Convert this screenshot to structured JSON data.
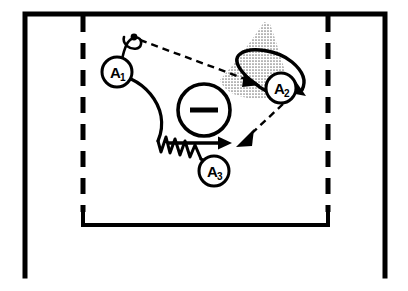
{
  "figure": {
    "title": "",
    "background_color": "#ffffff",
    "stroke_color": "#000000",
    "stipple_color": "#8c8c8c",
    "width": 408,
    "height": 291
  },
  "frames": {
    "outer": {
      "name": "outer-solid-frame",
      "style": "solid",
      "sides": [
        "top",
        "left",
        "right"
      ],
      "x": 25,
      "y": 14,
      "width": 360,
      "height": 262,
      "stroke_width": 5
    },
    "inner": {
      "name": "inner-dashed-frame",
      "style": "dashed-sides-solid-bottom",
      "sides": [
        "left",
        "right",
        "bottom"
      ],
      "x": 83,
      "y": 14,
      "width": 245,
      "height": 211,
      "stroke_width": 5,
      "dash_pattern": "14 10"
    }
  },
  "nodes": [
    {
      "id": "A1",
      "label": "A",
      "subscript": "1",
      "cx": 117,
      "cy": 72,
      "r": 15,
      "name": "node-a1"
    },
    {
      "id": "A2",
      "label": "A",
      "subscript": "2",
      "cx": 281,
      "cy": 88,
      "r": 15,
      "name": "node-a2"
    },
    {
      "id": "A3",
      "label": "A",
      "subscript": "3",
      "cx": 214,
      "cy": 171,
      "r": 15,
      "name": "node-a3"
    }
  ],
  "center_symbol": {
    "name": "minus-circle-symbol",
    "glyph": "minus",
    "cx": 204,
    "cy": 110,
    "r": 26,
    "bar_half_width": 14,
    "bar_thickness": 5
  },
  "antenna": {
    "name": "a1-antenna",
    "dot_cx": 133,
    "dot_cy": 37,
    "dot_r": 3.2,
    "loop_label": "teardrop-loop"
  },
  "stipple_region": {
    "name": "a2-beam-cone",
    "description": "halftone dotted cone / beam spreading up-left from A2",
    "fill": "#8c8c8c",
    "opacity": 0.55
  },
  "edges": [
    {
      "id": "e1",
      "name": "edge-a1-to-a2-dashed",
      "from": "A1-antenna",
      "to": "A2",
      "style": "dashed",
      "arrowhead": "solid-triangle"
    },
    {
      "id": "e2",
      "name": "edge-a1-to-a3-wavy",
      "from": "A1",
      "to": "A3",
      "style": "curve-then-zigzag",
      "arrowhead": "none"
    },
    {
      "id": "e3",
      "name": "edge-a3-straight-arrow",
      "from": "A3-region",
      "to": "right",
      "style": "solid",
      "arrowhead": "solid-triangle"
    },
    {
      "id": "e4",
      "name": "edge-a2-hook-arrow",
      "from": "A2",
      "to": "right-down",
      "style": "solid-hook-curve",
      "arrowhead": "solid-triangle"
    },
    {
      "id": "e5",
      "name": "edge-a2-to-lower-left-dashed",
      "from": "A2",
      "to": "lower-left",
      "style": "dashed",
      "arrowhead": "solid-triangle"
    }
  ]
}
